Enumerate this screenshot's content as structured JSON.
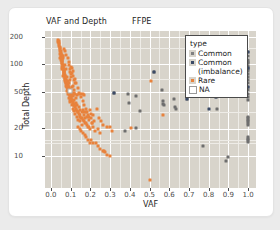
{
  "chart_data": {
    "type": "scatter",
    "title": "VAF and Depth",
    "strip_label": "FFPE",
    "xlabel": "VAF",
    "ylabel": "Total Depth",
    "xlim": [
      -0.03,
      1.04
    ],
    "ylim_log": [
      4.5,
      230
    ],
    "yscale": "log",
    "grid": true,
    "panel_color": "#d8d4cb",
    "grid_color": "#ffffff",
    "xticks": [
      "0.0",
      "0.1",
      "0.2",
      "0.3",
      "0.4",
      "0.5",
      "0.6",
      "0.7",
      "0.8",
      "0.9",
      "1.0"
    ],
    "xtick_values": [
      0.0,
      0.1,
      0.2,
      0.3,
      0.4,
      0.5,
      0.6,
      0.7,
      0.8,
      0.9,
      1.0
    ],
    "yticks": [
      "10",
      "20",
      "50",
      "100",
      "200"
    ],
    "ytick_values": [
      10,
      20,
      50,
      100,
      200
    ],
    "legend": {
      "title": "type",
      "position": "inside-top-right",
      "entries": [
        {
          "label": "Common",
          "color": "#808080",
          "shape": "square"
        },
        {
          "label": "Common",
          "color": "#3b4a66",
          "shape": "square",
          "continuation": "(imbalance)"
        },
        {
          "label": "Rare",
          "color": "#e8823c",
          "shape": "square"
        },
        {
          "label": "NA",
          "color": "#ffffff",
          "shape": "square-open"
        }
      ]
    },
    "series": [
      {
        "name": "Rare",
        "color": "#e8823c",
        "points": [
          [
            0.035,
            185
          ],
          [
            0.038,
            176
          ],
          [
            0.04,
            168
          ],
          [
            0.042,
            160
          ],
          [
            0.044,
            152
          ],
          [
            0.046,
            146
          ],
          [
            0.048,
            140
          ],
          [
            0.05,
            134
          ],
          [
            0.05,
            128
          ],
          [
            0.052,
            124
          ],
          [
            0.053,
            120
          ],
          [
            0.054,
            116
          ],
          [
            0.055,
            112
          ],
          [
            0.056,
            108
          ],
          [
            0.057,
            105
          ],
          [
            0.058,
            102
          ],
          [
            0.059,
            99
          ],
          [
            0.06,
            96
          ],
          [
            0.061,
            93
          ],
          [
            0.062,
            90
          ],
          [
            0.063,
            88
          ],
          [
            0.064,
            86
          ],
          [
            0.065,
            84
          ],
          [
            0.066,
            82
          ],
          [
            0.067,
            80
          ],
          [
            0.068,
            78
          ],
          [
            0.069,
            76
          ],
          [
            0.07,
            74
          ],
          [
            0.071,
            72
          ],
          [
            0.072,
            70
          ],
          [
            0.073,
            69
          ],
          [
            0.074,
            67
          ],
          [
            0.075,
            66
          ],
          [
            0.076,
            64
          ],
          [
            0.077,
            63
          ],
          [
            0.078,
            62
          ],
          [
            0.079,
            60
          ],
          [
            0.08,
            59
          ],
          [
            0.081,
            58
          ],
          [
            0.082,
            57
          ],
          [
            0.083,
            56
          ],
          [
            0.084,
            55
          ],
          [
            0.085,
            54
          ],
          [
            0.086,
            53
          ],
          [
            0.087,
            52
          ],
          [
            0.088,
            51
          ],
          [
            0.089,
            50
          ],
          [
            0.09,
            49
          ],
          [
            0.092,
            48
          ],
          [
            0.094,
            47
          ],
          [
            0.096,
            46
          ],
          [
            0.098,
            45
          ],
          [
            0.1,
            44
          ],
          [
            0.102,
            43
          ],
          [
            0.104,
            42
          ],
          [
            0.106,
            41
          ],
          [
            0.108,
            40
          ],
          [
            0.11,
            39
          ],
          [
            0.112,
            38
          ],
          [
            0.114,
            37
          ],
          [
            0.116,
            36
          ],
          [
            0.118,
            36
          ],
          [
            0.12,
            35
          ],
          [
            0.123,
            34
          ],
          [
            0.126,
            33
          ],
          [
            0.129,
            32
          ],
          [
            0.132,
            31
          ],
          [
            0.135,
            30
          ],
          [
            0.138,
            30
          ],
          [
            0.141,
            29
          ],
          [
            0.145,
            28
          ],
          [
            0.149,
            27
          ],
          [
            0.153,
            26
          ],
          [
            0.157,
            26
          ],
          [
            0.161,
            25
          ],
          [
            0.166,
            24
          ],
          [
            0.171,
            23
          ],
          [
            0.176,
            23
          ],
          [
            0.181,
            22
          ],
          [
            0.187,
            21
          ],
          [
            0.193,
            21
          ],
          [
            0.2,
            20
          ],
          [
            0.045,
            130
          ],
          [
            0.048,
            118
          ],
          [
            0.052,
            110
          ],
          [
            0.056,
            100
          ],
          [
            0.06,
            92
          ],
          [
            0.064,
            85
          ],
          [
            0.068,
            79
          ],
          [
            0.072,
            73
          ],
          [
            0.076,
            68
          ],
          [
            0.08,
            64
          ],
          [
            0.085,
            60
          ],
          [
            0.09,
            56
          ],
          [
            0.095,
            53
          ],
          [
            0.1,
            50
          ],
          [
            0.105,
            47
          ],
          [
            0.11,
            45
          ],
          [
            0.066,
            146
          ],
          [
            0.071,
            138
          ],
          [
            0.078,
            126
          ],
          [
            0.084,
            116
          ],
          [
            0.09,
            105
          ],
          [
            0.093,
            98
          ],
          [
            0.062,
            116
          ],
          [
            0.059,
            122
          ],
          [
            0.055,
            94
          ],
          [
            0.057,
            88
          ],
          [
            0.063,
            75
          ],
          [
            0.069,
            66
          ],
          [
            0.075,
            58
          ],
          [
            0.081,
            51
          ],
          [
            0.087,
            47
          ],
          [
            0.093,
            43
          ],
          [
            0.099,
            39
          ],
          [
            0.105,
            36
          ],
          [
            0.111,
            33
          ],
          [
            0.117,
            31
          ],
          [
            0.124,
            29
          ],
          [
            0.131,
            27
          ],
          [
            0.139,
            25
          ],
          [
            0.147,
            24
          ],
          [
            0.156,
            22
          ],
          [
            0.1,
            78
          ],
          [
            0.103,
            72
          ],
          [
            0.097,
            82
          ],
          [
            0.108,
            92
          ],
          [
            0.112,
            84
          ],
          [
            0.12,
            70
          ],
          [
            0.128,
            62
          ],
          [
            0.136,
            55
          ],
          [
            0.144,
            49
          ],
          [
            0.152,
            44
          ],
          [
            0.16,
            40
          ],
          [
            0.168,
            36
          ],
          [
            0.176,
            33
          ],
          [
            0.184,
            30
          ],
          [
            0.193,
            27
          ],
          [
            0.13,
            46
          ],
          [
            0.14,
            47
          ],
          [
            0.15,
            48
          ],
          [
            0.16,
            48
          ],
          [
            0.17,
            46
          ],
          [
            0.095,
            68
          ],
          [
            0.11,
            58
          ],
          [
            0.118,
            49
          ],
          [
            0.125,
            43
          ],
          [
            0.18,
            30
          ],
          [
            0.19,
            28
          ],
          [
            0.2,
            32
          ],
          [
            0.205,
            26
          ],
          [
            0.21,
            23
          ],
          [
            0.215,
            21
          ],
          [
            0.205,
            29
          ],
          [
            0.215,
            28
          ],
          [
            0.22,
            24
          ],
          [
            0.225,
            19
          ],
          [
            0.172,
            17
          ],
          [
            0.18,
            16
          ],
          [
            0.19,
            15
          ],
          [
            0.196,
            14
          ],
          [
            0.205,
            15
          ],
          [
            0.215,
            14
          ],
          [
            0.228,
            14
          ],
          [
            0.237,
            13
          ],
          [
            0.248,
            12
          ],
          [
            0.262,
            11.5
          ],
          [
            0.272,
            11.2
          ],
          [
            0.285,
            10.3
          ],
          [
            0.297,
            10.0
          ],
          [
            0.15,
            19
          ],
          [
            0.16,
            18
          ],
          [
            0.145,
            20
          ],
          [
            0.138,
            21
          ],
          [
            0.3,
            21
          ],
          [
            0.285,
            21
          ],
          [
            0.31,
            19
          ],
          [
            0.405,
            20.5
          ],
          [
            0.505,
            65
          ],
          [
            0.57,
            28
          ],
          [
            0.5,
            5.5
          ],
          [
            0.27,
            11.5
          ],
          [
            0.245,
            26
          ],
          [
            0.235,
            33
          ],
          [
            0.255,
            24
          ],
          [
            0.265,
            22
          ],
          [
            0.24,
            20
          ],
          [
            0.25,
            18
          ],
          [
            0.08,
            72
          ],
          [
            0.085,
            66
          ],
          [
            0.078,
            88
          ],
          [
            0.073,
            98
          ],
          [
            0.106,
            56
          ],
          [
            0.115,
            52
          ],
          [
            0.122,
            48
          ],
          [
            0.092,
            62
          ],
          [
            0.088,
            58
          ],
          [
            0.098,
            54
          ],
          [
            0.102,
            46
          ],
          [
            0.094,
            41
          ],
          [
            0.107,
            48
          ],
          [
            0.113,
            46
          ],
          [
            0.119,
            41
          ],
          [
            0.126,
            38
          ],
          [
            0.133,
            36
          ],
          [
            0.14,
            34
          ],
          [
            0.148,
            32
          ],
          [
            0.157,
            30
          ],
          [
            0.165,
            28
          ],
          [
            0.174,
            26
          ],
          [
            0.058,
            112
          ],
          [
            0.054,
            126
          ],
          [
            0.05,
            140
          ],
          [
            0.047,
            155
          ],
          [
            0.043,
            172
          ],
          [
            0.04,
            180
          ],
          [
            0.1,
            93
          ],
          [
            0.096,
            88
          ],
          [
            0.105,
            80
          ],
          [
            0.112,
            74
          ],
          [
            0.118,
            68
          ],
          [
            0.124,
            63
          ],
          [
            0.16,
            32
          ],
          [
            0.168,
            30
          ],
          [
            0.182,
            27
          ],
          [
            0.195,
            25
          ],
          [
            0.208,
            23
          ]
        ]
      },
      {
        "name": "Common",
        "color": "#6e6e6e",
        "points": [
          [
            0.32,
            49
          ],
          [
            0.377,
            19
          ],
          [
            0.39,
            47
          ],
          [
            0.395,
            38
          ],
          [
            0.43,
            45
          ],
          [
            0.43,
            20.5
          ],
          [
            0.45,
            31
          ],
          [
            0.52,
            83
          ],
          [
            0.565,
            52
          ],
          [
            0.567,
            40
          ],
          [
            0.57,
            37
          ],
          [
            0.575,
            36
          ],
          [
            0.625,
            42
          ],
          [
            0.63,
            34
          ],
          [
            0.633,
            33
          ],
          [
            0.69,
            42
          ],
          [
            0.77,
            13
          ],
          [
            0.8,
            54
          ],
          [
            0.838,
            44
          ],
          [
            0.84,
            33
          ],
          [
            0.89,
            8.8
          ],
          [
            0.9,
            9.8
          ],
          [
            0.95,
            95
          ],
          [
            1.0,
            135
          ],
          [
            1.0,
            122
          ],
          [
            1.0,
            112
          ],
          [
            1.0,
            104
          ],
          [
            1.0,
            96
          ],
          [
            1.0,
            90
          ],
          [
            1.0,
            84
          ],
          [
            1.0,
            78
          ],
          [
            1.0,
            73
          ],
          [
            1.0,
            68
          ],
          [
            1.0,
            62
          ],
          [
            1.0,
            57
          ],
          [
            1.0,
            47
          ],
          [
            1.0,
            44
          ],
          [
            1.0,
            41
          ],
          [
            1.0,
            27
          ],
          [
            1.0,
            25
          ],
          [
            1.0,
            23
          ],
          [
            1.0,
            22
          ],
          [
            1.0,
            16
          ],
          [
            1.0,
            15
          ],
          [
            1.0,
            14.2
          ],
          [
            1.0,
            106
          ],
          [
            1.0,
            88
          ],
          [
            1.0,
            52
          ],
          [
            1.0,
            26
          ],
          [
            1.0,
            24
          ],
          [
            1.0,
            15.5
          ]
        ]
      },
      {
        "name": "Common (imbalance)",
        "color": "#3b4a66",
        "points": [
          [
            0.32,
            49
          ],
          [
            0.52,
            83
          ],
          [
            0.69,
            42
          ],
          [
            0.8,
            54
          ],
          [
            0.838,
            44
          ],
          [
            0.8,
            33
          ],
          [
            1.0,
            135
          ],
          [
            1.0,
            90
          ],
          [
            1.0,
            57
          ]
        ]
      },
      {
        "name": "NA",
        "color": "#ffffff",
        "points": [
          [
            0.093,
            53
          ],
          [
            0.95,
            95
          ]
        ]
      }
    ]
  }
}
